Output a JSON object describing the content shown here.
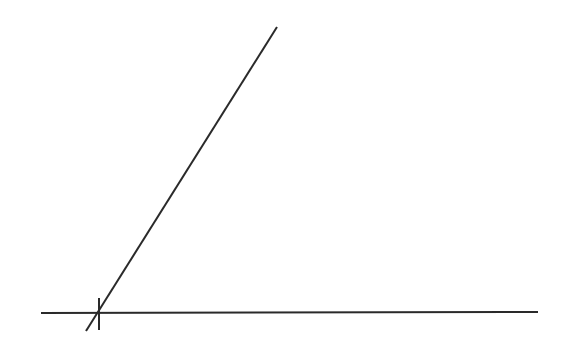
{
  "diagram": {
    "width": 574,
    "height": 360,
    "background": "#ffffff",
    "stroke_color": "#2a2a2a",
    "stroke_width": 2,
    "lines": [
      {
        "id": "baseline",
        "x1": 41,
        "y1": 313,
        "x2": 538,
        "y2": 312
      },
      {
        "id": "diagonal-ray",
        "x1": 86,
        "y1": 331,
        "x2": 277,
        "y2": 27
      },
      {
        "id": "intersection-tick",
        "x1": 99,
        "y1": 298,
        "x2": 99,
        "y2": 330
      }
    ]
  }
}
